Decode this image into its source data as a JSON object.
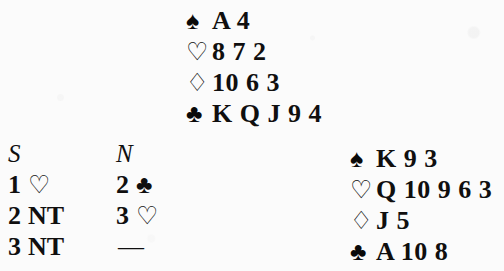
{
  "page": {
    "background_color": "#fbfbfb",
    "ink_color": "#100f0f"
  },
  "suits": {
    "spade": {
      "name": "spade-symbol",
      "glyph": "♠",
      "fill": "solid"
    },
    "heart": {
      "name": "heart-symbol",
      "glyph": "♡",
      "fill": "hollow"
    },
    "diamond": {
      "name": "diamond-symbol",
      "glyph": "♢",
      "fill": "hollow"
    },
    "club": {
      "name": "club-symbol",
      "glyph": "♣",
      "fill": "solid"
    }
  },
  "north_hand": {
    "label": "North hand",
    "rows": [
      {
        "suit": "spade",
        "glyph": "♠",
        "cards": "A 4"
      },
      {
        "suit": "heart",
        "glyph": "♡",
        "cards": "8 7 2"
      },
      {
        "suit": "diamond",
        "glyph": "♢",
        "cards": "10 6 3"
      },
      {
        "suit": "club",
        "glyph": "♣",
        "cards": "K Q J 9 4"
      }
    ]
  },
  "east_hand": {
    "label": "East hand",
    "rows": [
      {
        "suit": "spade",
        "glyph": "♠",
        "cards": "K 9 3"
      },
      {
        "suit": "heart",
        "glyph": "♡",
        "cards": "Q 10 9 6 3"
      },
      {
        "suit": "diamond",
        "glyph": "♢",
        "cards": "J 5"
      },
      {
        "suit": "club",
        "glyph": "♣",
        "cards": "A 10 8"
      }
    ]
  },
  "bidding": {
    "headers": {
      "south": "S",
      "north": "N"
    },
    "rows": [
      {
        "south": {
          "level": "1",
          "denom": "♡",
          "is_symbol": true,
          "suit": "heart"
        },
        "north": {
          "level": "2",
          "denom": "♣",
          "is_symbol": true,
          "suit": "club"
        }
      },
      {
        "south": {
          "level": "2",
          "denom": "NT",
          "is_symbol": false,
          "suit": ""
        },
        "north": {
          "level": "3",
          "denom": "♡",
          "is_symbol": true,
          "suit": "heart"
        }
      },
      {
        "south": {
          "level": "3",
          "denom": "NT",
          "is_symbol": false,
          "suit": ""
        },
        "north": {
          "level": "",
          "denom": "—",
          "is_symbol": false,
          "suit": "",
          "is_dash": true
        }
      }
    ]
  }
}
